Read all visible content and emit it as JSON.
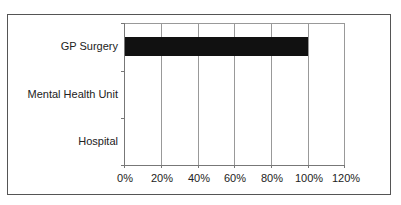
{
  "chart_data": {
    "type": "bar",
    "orientation": "horizontal",
    "title": "",
    "xlabel": "",
    "ylabel": "",
    "categories": [
      "GP Surgery",
      "Mental Health Unit",
      "Hospital"
    ],
    "values": [
      100,
      0,
      0
    ],
    "value_unit": "%",
    "xlim": [
      0,
      120
    ],
    "x_ticks": [
      "0%",
      "20%",
      "40%",
      "60%",
      "80%",
      "100%",
      "120%"
    ],
    "grid": {
      "vertical": true,
      "horizontal": false
    },
    "legend": null,
    "bar_color": "#111111"
  }
}
